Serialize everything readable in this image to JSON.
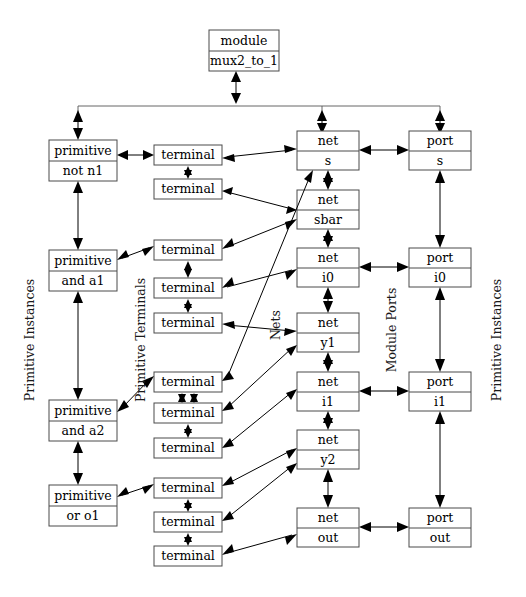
{
  "diagram": {
    "column_labels": {
      "left": "Primitive Instances",
      "terminals": "Primitive Terminals",
      "nets": "Nets",
      "ports": "Module Ports",
      "right": "Primitive Instances"
    },
    "module": {
      "type_label": "module",
      "name_label": "mux2_to_1"
    },
    "primitives": [
      {
        "type_label": "primitive",
        "name_label": "not n1"
      },
      {
        "type_label": "primitive",
        "name_label": "and a1"
      },
      {
        "type_label": "primitive",
        "name_label": "and a2"
      },
      {
        "type_label": "primitive",
        "name_label": "or o1"
      }
    ],
    "terminals": [
      {
        "label": "terminal"
      },
      {
        "label": "terminal"
      },
      {
        "label": "terminal"
      },
      {
        "label": "terminal"
      },
      {
        "label": "terminal"
      },
      {
        "label": "terminal"
      },
      {
        "label": "terminal"
      },
      {
        "label": "terminal"
      },
      {
        "label": "terminal"
      },
      {
        "label": "terminal"
      },
      {
        "label": "terminal"
      }
    ],
    "nets": [
      {
        "type_label": "net",
        "name_label": "s"
      },
      {
        "type_label": "net",
        "name_label": "sbar"
      },
      {
        "type_label": "net",
        "name_label": "i0"
      },
      {
        "type_label": "net",
        "name_label": "y1"
      },
      {
        "type_label": "net",
        "name_label": "i1"
      },
      {
        "type_label": "net",
        "name_label": "y2"
      },
      {
        "type_label": "net",
        "name_label": "out"
      }
    ],
    "ports": [
      {
        "type_label": "port",
        "name_label": "s"
      },
      {
        "type_label": "port",
        "name_label": "i0"
      },
      {
        "type_label": "port",
        "name_label": "i1"
      },
      {
        "type_label": "port",
        "name_label": "out"
      }
    ],
    "colors": {
      "background": "#ffffff",
      "box_stroke": "#4a4a4a",
      "edge": "#000000",
      "text": "#000000"
    }
  }
}
